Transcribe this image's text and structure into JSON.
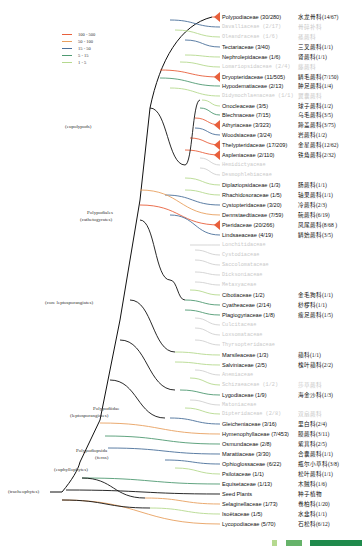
{
  "legend": [
    {
      "label": "100 - 500",
      "color": "#e8603c"
    },
    {
      "label": "50 - 100",
      "color": "#e8a060"
    },
    {
      "label": "15 - 50",
      "color": "#4a6f9a"
    },
    {
      "label": "5 - 15",
      "color": "#4f9a72"
    },
    {
      "label": "1 - 5",
      "color": "#b5d98f"
    }
  ],
  "clades": [
    {
      "label": "(eupolypods)",
      "x": 65,
      "y": 127
    },
    {
      "label": "Polypodiales",
      "x": 87,
      "y": 213
    },
    {
      "label": "(cathetogyrates)",
      "x": 80,
      "y": 220
    },
    {
      "label": "(core leptosporangiates)",
      "x": 45,
      "y": 303
    },
    {
      "label": "Polypodiidae",
      "x": 93,
      "y": 409
    },
    {
      "label": "(leptosporangiates)",
      "x": 70,
      "y": 416
    },
    {
      "label": "Polypodiopsida",
      "x": 76,
      "y": 451
    },
    {
      "label": "(ferns)",
      "x": 95,
      "y": 458
    },
    {
      "label": "(euphyllophytes)",
      "x": 54,
      "y": 470
    },
    {
      "label": "(tracheophytes)",
      "x": 8,
      "y": 492
    }
  ],
  "leaves": [
    {
      "name": "Polypodiaceae (30/280)",
      "cn": "水龙骨科(14/67)",
      "y": 17,
      "faint": false,
      "color": "#e8603c",
      "wedge": true
    },
    {
      "name": "Davalliaceae (2/17)",
      "cn": "骨碎补科",
      "y": 27,
      "faint": true,
      "color": "#4a6f9a"
    },
    {
      "name": "Oleandraceae (1/6)",
      "cn": "蓧蕨科",
      "y": 37,
      "faint": true,
      "color": "#b5d98f"
    },
    {
      "name": "Tectariaceae (3/40)",
      "cn": "三叉蕨科(1/1)",
      "y": 47,
      "faint": false,
      "color": "#4a6f9a"
    },
    {
      "name": "Nephrolepidaceae (1/6)",
      "cn": "肾蕨科(1/1)",
      "y": 57,
      "faint": false,
      "color": "#b5d98f"
    },
    {
      "name": "Lomariopsidaceae (2/4)",
      "cn": "藤蕨科",
      "y": 67,
      "faint": true,
      "color": "#b5d98f"
    },
    {
      "name": "Dryopteridaceae (11/505)",
      "cn": "鳞毛蕨科(7/150)",
      "y": 77,
      "faint": false,
      "color": "#e8603c",
      "wedge": true
    },
    {
      "name": "Hypodematiaceae (2/13)",
      "cn": "肿足蕨科(1/4)",
      "y": 86,
      "faint": false,
      "color": "#4f9a72"
    },
    {
      "name": "Didymochlaenaceae (1/1)",
      "cn": "翼囊蕨科",
      "y": 96,
      "faint": true,
      "color": "#b5d98f"
    },
    {
      "name": "Onocleaceae (3/5)",
      "cn": "球子蕨科(1/2)",
      "y": 106,
      "faint": false,
      "color": "#b5d98f"
    },
    {
      "name": "Blechnaceae (7/15)",
      "cn": "乌毛蕨科(3/5)",
      "y": 115,
      "faint": false,
      "color": "#4f9a72"
    },
    {
      "name": "Athyriaceae (3/323)",
      "cn": "蹄盖蕨科(3/75)",
      "y": 125,
      "faint": false,
      "color": "#e8603c",
      "wedge": true
    },
    {
      "name": "Woodsiaceae (3/24)",
      "cn": "岩蕨科(1/2)",
      "y": 135,
      "faint": false,
      "color": "#4a6f9a"
    },
    {
      "name": "Thelypteridaceae (17/209)",
      "cn": "金星蕨科(12/62)",
      "y": 145,
      "faint": false,
      "color": "#e8603c",
      "wedge": true
    },
    {
      "name": "Aspleniaceae (2/110)",
      "cn": "铁角蕨科(2/32)",
      "y": 155,
      "faint": false,
      "color": "#e8603c",
      "wedge": true
    },
    {
      "name": "Hemidictyaceae",
      "cn": "",
      "y": 165,
      "faint": true,
      "color": "#d0d0d0"
    },
    {
      "name": "Desmophlebiaceae",
      "cn": "",
      "y": 175,
      "faint": true,
      "color": "#d0d0d0"
    },
    {
      "name": "Diplaziopsidaceae (1/3)",
      "cn": "肠蕨科(1/1)",
      "y": 185,
      "faint": false,
      "color": "#b5d98f"
    },
    {
      "name": "Rhachidosoraceae (1/5)",
      "cn": "轴果蕨科(1/1)",
      "y": 195,
      "faint": false,
      "color": "#b5d98f"
    },
    {
      "name": "Cystopteridaceae (3/20)",
      "cn": "冷蕨科(2/3)",
      "y": 205,
      "faint": false,
      "color": "#4a6f9a"
    },
    {
      "name": "Dennstaedtiaceae (7/59)",
      "cn": "碗蕨科(6/19)",
      "y": 215,
      "faint": false,
      "color": "#e8a060"
    },
    {
      "name": "Pteridaceae (20/266)",
      "cn": "凤尾蕨科(8/68 )",
      "y": 225,
      "faint": false,
      "color": "#e8603c",
      "wedge": true
    },
    {
      "name": "Lindsaeaceae (4/19)",
      "cn": "鳞始蕨科(3/5)",
      "y": 235,
      "faint": false,
      "color": "#4a6f9a"
    },
    {
      "name": "Lonchitidaceae",
      "cn": "",
      "y": 245,
      "faint": true,
      "color": "#d0d0d0"
    },
    {
      "name": "Cystodiaceae",
      "cn": "",
      "y": 255,
      "faint": true,
      "color": "#d0d0d0"
    },
    {
      "name": "Saccolomataceae",
      "cn": "",
      "y": 265,
      "faint": true,
      "color": "#d0d0d0"
    },
    {
      "name": "Dicksoniaceae",
      "cn": "",
      "y": 275,
      "faint": true,
      "color": "#d0d0d0"
    },
    {
      "name": "Metaxyaceae",
      "cn": "",
      "y": 285,
      "faint": true,
      "color": "#d0d0d0"
    },
    {
      "name": "Cibotiaceae (1/2)",
      "cn": "金毛狗科(1/1)",
      "y": 295,
      "faint": false,
      "color": "#b5d98f"
    },
    {
      "name": "Cyatheaceae (2/14)",
      "cn": "桫椤科(1/1)",
      "y": 305,
      "faint": false,
      "color": "#4f9a72"
    },
    {
      "name": "Plagiogyriaceae (1/8)",
      "cn": "瘤足蕨科(1/5)",
      "y": 315,
      "faint": false,
      "color": "#4f9a72"
    },
    {
      "name": "Culcitaceae",
      "cn": "",
      "y": 325,
      "faint": true,
      "color": "#d0d0d0"
    },
    {
      "name": "Loxsomataceae",
      "cn": "",
      "y": 335,
      "faint": true,
      "color": "#d0d0d0"
    },
    {
      "name": "Thyrsopteridaceae",
      "cn": "",
      "y": 345,
      "faint": true,
      "color": "#d0d0d0"
    },
    {
      "name": "Marsileaceae (1/3)",
      "cn": "蘋科(1/1)",
      "y": 355,
      "faint": false,
      "color": "#b5d98f"
    },
    {
      "name": "Salviniaceae (2/5)",
      "cn": "槐叶蘋科(2/2)",
      "y": 365,
      "faint": false,
      "color": "#b5d98f"
    },
    {
      "name": "Anemiaceae",
      "cn": "",
      "y": 375,
      "faint": true,
      "color": "#d0d0d0"
    },
    {
      "name": "Schizaeaceae (1/2)",
      "cn": "莎草蕨科",
      "y": 385,
      "faint": true,
      "color": "#b5d98f"
    },
    {
      "name": "Lygodiaceae (1/9)",
      "cn": "海金沙科(1/3)",
      "y": 395,
      "faint": false,
      "color": "#4f9a72"
    },
    {
      "name": "Matoniaceae",
      "cn": "",
      "y": 405,
      "faint": true,
      "color": "#d0d0d0"
    },
    {
      "name": "Dipteridaceae (2/8)",
      "cn": "双扇蕨科",
      "y": 414,
      "faint": true,
      "color": "#b5d98f"
    },
    {
      "name": "Gleicheniaceae (3/16)",
      "cn": "里白科(2/4)",
      "y": 424,
      "faint": false,
      "color": "#4a6f9a"
    },
    {
      "name": "Hymenophyllaceae (7/453)",
      "cn": "膜蕨科(3/11)",
      "y": 434,
      "faint": false,
      "color": "#e8a060"
    },
    {
      "name": "Osmundaceae (2/8)",
      "cn": "紫萁科(2/5)",
      "y": 444,
      "faint": false,
      "color": "#4f9a72"
    },
    {
      "name": "Marattiaceae (3/30)",
      "cn": "合囊蕨科(1/1)",
      "y": 454,
      "faint": false,
      "color": "#4a6f9a"
    },
    {
      "name": "Ophioglossaceae (6/22)",
      "cn": "瓶尔小草科(3/8)",
      "y": 464,
      "faint": false,
      "color": "#4a6f9a"
    },
    {
      "name": "Psilotaceae (1/1)",
      "cn": "松叶蕨科(1/1)",
      "y": 474,
      "faint": false,
      "color": "#b5d98f"
    },
    {
      "name": "Equisetaceae (1/13)",
      "cn": "木贼科(1/6)",
      "y": 484,
      "faint": false,
      "color": "#4f9a72"
    },
    {
      "name": "Seed Plants",
      "cn": "种子植物",
      "y": 494,
      "faint": false,
      "color": "#111111"
    },
    {
      "name": "Selaginellaceae (1/73)",
      "cn": "卷柏科(1/20)",
      "y": 504,
      "faint": false,
      "color": "#e8a060"
    },
    {
      "name": "Isoëtaceae (1/5)",
      "cn": "水韭科(1/1)",
      "y": 514,
      "faint": false,
      "color": "#b5d98f"
    },
    {
      "name": "Lycopodiaceae (5/70)",
      "cn": "石松科(6/12)",
      "y": 524,
      "faint": false,
      "color": "#e8a060"
    }
  ],
  "footer_bars": [
    {
      "color": "#b5d98f",
      "x": 272,
      "w": 5
    },
    {
      "color": "#66b36a",
      "x": 286,
      "w": 16
    },
    {
      "color": "#1f8a4c",
      "x": 310,
      "w": 52
    }
  ]
}
